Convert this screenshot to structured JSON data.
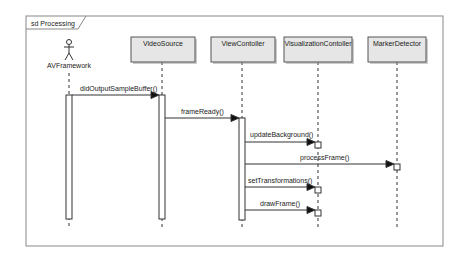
{
  "frame": {
    "label": "sd Processing"
  },
  "lifelines": [
    {
      "name": "AVFramework",
      "kind": "actor",
      "x": 69
    },
    {
      "name": "VideoSource",
      "kind": "object",
      "x": 162
    },
    {
      "name": "ViewContoller",
      "kind": "object",
      "x": 242
    },
    {
      "name": "VisualizationContoller",
      "kind": "object",
      "x": 318
    },
    {
      "name": "MarkerDetector",
      "kind": "object",
      "x": 397
    }
  ],
  "messages": [
    {
      "label": "didOutputSampleBuffer()",
      "from": 0,
      "to": 1,
      "y": 95
    },
    {
      "label": "frameReady()",
      "from": 1,
      "to": 2,
      "y": 118
    },
    {
      "label": "updateBackground()",
      "from": 2,
      "to": 3,
      "y": 142
    },
    {
      "label": "processFrame()",
      "from": 2,
      "to": 4,
      "y": 164
    },
    {
      "label": "setTransformations()",
      "from": 2,
      "to": 3,
      "y": 187
    },
    {
      "label": "drawFrame()",
      "from": 2,
      "to": 3,
      "y": 210
    }
  ],
  "colors": {
    "line": "#333333",
    "box_fill": "#e6e6e6",
    "box_border": "#555555",
    "frame": "#888888"
  }
}
